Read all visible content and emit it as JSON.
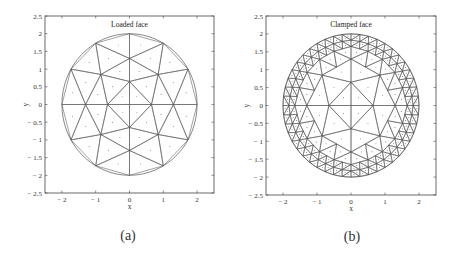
{
  "chart_data": [
    {
      "type": "mesh",
      "panel_label": "(a)",
      "title": "Loaded face",
      "xlabel": "x",
      "ylabel": "y",
      "xlim": [
        -2.5,
        2.5
      ],
      "ylim": [
        -2.5,
        2.5
      ],
      "xticks": [
        "-2",
        "-1",
        "0",
        "1",
        "2"
      ],
      "yticks": [
        "2.5",
        "2",
        "1.5",
        "1",
        "0.5",
        "0",
        "-0.5",
        "-1",
        "-1.5",
        "-2",
        "-2.5"
      ],
      "domain": "circle radius 2 centered at origin",
      "mesh": "coarse triangular mesh, 40 elements, centroid dots",
      "refinement_levels": 0
    },
    {
      "type": "mesh",
      "panel_label": "(b)",
      "title": "Clamped face",
      "xlabel": "x",
      "ylabel": "y",
      "xlim": [
        -2.5,
        2.5
      ],
      "ylim": [
        -2.5,
        2.5
      ],
      "xticks": [
        "-2",
        "-1",
        "0",
        "1",
        "2"
      ],
      "yticks": [
        "2.5",
        "2",
        "1.5",
        "1",
        "0.5",
        "0",
        "-0.5",
        "-1",
        "-1.5",
        "-2",
        "-2.5"
      ],
      "domain": "circle radius 2 centered at origin",
      "mesh": "same coarse mesh with boundary elements locally refined",
      "refinement_levels": 2
    }
  ],
  "panels": [
    {
      "caption": "(a)",
      "title": "Loaded face",
      "xlabel": "x",
      "ylabel": "y",
      "box": [
        45,
        16,
        214,
        193
      ],
      "refine": 0
    },
    {
      "caption": "(b)",
      "title": "Clamped face",
      "xlabel": "x",
      "ylabel": "y",
      "box": [
        266,
        16,
        436,
        195
      ],
      "refine": 2
    }
  ],
  "colors": {
    "line": "#555555",
    "axis": "#444444",
    "dot": "#333333"
  }
}
